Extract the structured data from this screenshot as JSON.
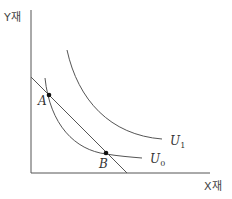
{
  "diagram": {
    "type": "indifference-curve-budget-line",
    "axes": {
      "x_label": "X재",
      "y_label": "Y재"
    },
    "curves": [
      {
        "id": "U0",
        "label": "U",
        "subscript": "0"
      },
      {
        "id": "U1",
        "label": "U",
        "subscript": "1"
      }
    ],
    "budget_line": {
      "label": ""
    },
    "points": [
      {
        "id": "A",
        "label": "A"
      },
      {
        "id": "B",
        "label": "B"
      }
    ],
    "colors": {
      "line": "#555555",
      "text": "#333333",
      "point": "#111111"
    }
  }
}
